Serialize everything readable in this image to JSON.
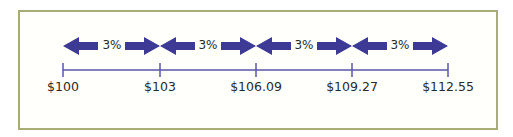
{
  "diagram": {
    "title": "",
    "rate_label": "3%",
    "segments": [
      {
        "from": "$100",
        "to": "$103",
        "label": "3%"
      },
      {
        "from": "$103",
        "to": "$106.09",
        "label": "3%"
      },
      {
        "from": "$106.09",
        "to": "$109.27",
        "label": "3%"
      },
      {
        "from": "$109.27",
        "to": "$112.55",
        "label": "3%"
      }
    ],
    "ticks": [
      "$100",
      "$103",
      "$106.09",
      "$109.27",
      "$112.55"
    ],
    "colors": {
      "arrow": "#3d3a95",
      "axis": "#5a57a8",
      "frame": "#a7ad74"
    }
  }
}
